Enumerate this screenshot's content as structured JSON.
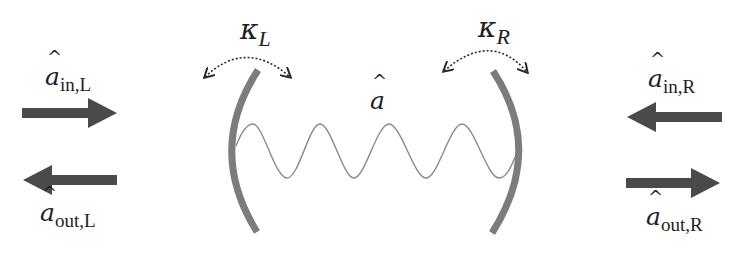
{
  "diagram": {
    "type": "optical cavity input-output schematic",
    "colors": {
      "arrow": "#4a4a4a",
      "mirror": "#7c7c7c",
      "wave": "#8a8a8a",
      "coupling_arrow": "#2a2a2a",
      "text": "#1e1e1e",
      "background": "#ffffff"
    },
    "cavity_mode": {
      "symbol": "a",
      "hat": "^",
      "label_text": "â"
    },
    "left": {
      "coupling": {
        "symbol": "κ",
        "subscript": "L"
      },
      "input": {
        "symbol": "a",
        "hat": "^",
        "subscript": "in,L",
        "direction": "right"
      },
      "output": {
        "symbol": "a",
        "hat": "^",
        "subscript": "out,L",
        "direction": "left"
      }
    },
    "right": {
      "coupling": {
        "symbol": "κ",
        "subscript": "R"
      },
      "input": {
        "symbol": "a",
        "hat": "^",
        "subscript": "in,R",
        "direction": "left"
      },
      "output": {
        "symbol": "a",
        "hat": "^",
        "subscript": "out,R",
        "direction": "right"
      }
    }
  }
}
